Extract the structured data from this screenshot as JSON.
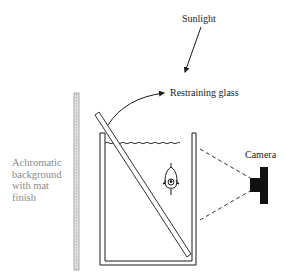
{
  "labels": {
    "sunlight": "Sunlight",
    "restraining_glass": "Restraining glass",
    "camera": "Camera",
    "background": "Achromatic\nbackground\nwith mat\nfinish"
  },
  "colors": {
    "ink": "#1a1a1a",
    "background_label": "#8a8a8a",
    "background_panel": "#c8c8c8"
  }
}
